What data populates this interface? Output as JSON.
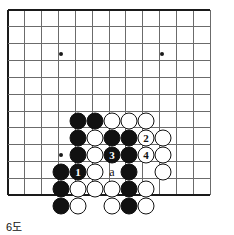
{
  "diagram": {
    "kind": "go-board-problem-diagram",
    "caption": "6도",
    "board": {
      "origin_x": 8,
      "origin_y": 10,
      "spacing": 16.85,
      "cols": 13,
      "rows": 12,
      "edges": [
        "left",
        "top",
        "bottom"
      ],
      "line_color": "#6b6b6b",
      "edge_color": "#1a1a1a",
      "star_points": [
        {
          "x": 61,
          "y": 54
        },
        {
          "x": 162,
          "y": 54
        },
        {
          "x": 61,
          "y": 155
        }
      ]
    },
    "colors": {
      "black_stone": "#111111",
      "white_stone": "#ffffff",
      "stone_outline": "#111111",
      "background": "#ffffff"
    },
    "stones": [
      {
        "x": 78,
        "y": 121,
        "color": "black",
        "label": ""
      },
      {
        "x": 95,
        "y": 121,
        "color": "black",
        "label": ""
      },
      {
        "x": 112,
        "y": 121,
        "color": "white",
        "label": ""
      },
      {
        "x": 129,
        "y": 121,
        "color": "white",
        "label": ""
      },
      {
        "x": 146,
        "y": 121,
        "color": "white",
        "label": ""
      },
      {
        "x": 78,
        "y": 138,
        "color": "black",
        "label": ""
      },
      {
        "x": 95,
        "y": 138,
        "color": "white",
        "label": ""
      },
      {
        "x": 112,
        "y": 138,
        "color": "black",
        "label": ""
      },
      {
        "x": 129,
        "y": 138,
        "color": "black",
        "label": ""
      },
      {
        "x": 146,
        "y": 138,
        "color": "white",
        "label": "2"
      },
      {
        "x": 163,
        "y": 138,
        "color": "white",
        "label": ""
      },
      {
        "x": 78,
        "y": 155,
        "color": "black",
        "label": ""
      },
      {
        "x": 95,
        "y": 155,
        "color": "white",
        "label": ""
      },
      {
        "x": 112,
        "y": 155,
        "color": "black",
        "label": "3"
      },
      {
        "x": 129,
        "y": 155,
        "color": "black",
        "label": ""
      },
      {
        "x": 146,
        "y": 155,
        "color": "white",
        "label": "4"
      },
      {
        "x": 163,
        "y": 155,
        "color": "white",
        "label": ""
      },
      {
        "x": 61,
        "y": 172,
        "color": "black",
        "label": ""
      },
      {
        "x": 78,
        "y": 172,
        "color": "black",
        "label": "1"
      },
      {
        "x": 95,
        "y": 172,
        "color": "white",
        "label": ""
      },
      {
        "x": 129,
        "y": 172,
        "color": "black",
        "label": ""
      },
      {
        "x": 163,
        "y": 172,
        "color": "white",
        "label": ""
      },
      {
        "x": 61,
        "y": 189,
        "color": "black",
        "label": ""
      },
      {
        "x": 78,
        "y": 189,
        "color": "white",
        "label": ""
      },
      {
        "x": 95,
        "y": 189,
        "color": "white",
        "label": ""
      },
      {
        "x": 112,
        "y": 189,
        "color": "white",
        "label": ""
      },
      {
        "x": 129,
        "y": 189,
        "color": "black",
        "label": ""
      },
      {
        "x": 146,
        "y": 189,
        "color": "white",
        "label": ""
      },
      {
        "x": 61,
        "y": 206,
        "color": "black",
        "label": ""
      },
      {
        "x": 78,
        "y": 206,
        "color": "white",
        "label": ""
      },
      {
        "x": 112,
        "y": 206,
        "color": "white",
        "label": ""
      },
      {
        "x": 129,
        "y": 206,
        "color": "black",
        "label": ""
      },
      {
        "x": 146,
        "y": 206,
        "color": "white",
        "label": ""
      }
    ],
    "point_labels": [
      {
        "x": 112,
        "y": 172,
        "text": "a"
      }
    ],
    "move_order": [
      {
        "number": "1",
        "color": "black"
      },
      {
        "number": "2",
        "color": "white"
      },
      {
        "number": "3",
        "color": "black"
      },
      {
        "number": "4",
        "color": "white"
      }
    ]
  }
}
